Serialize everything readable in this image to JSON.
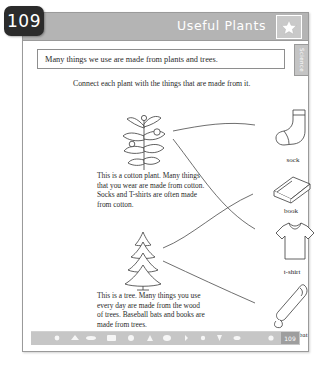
{
  "page": {
    "number_badge": "109",
    "footer_number": "109",
    "subject_tab": "Science"
  },
  "header": {
    "title": "Useful Plants",
    "star_icon": "star-icon"
  },
  "intro": {
    "text": "Many things we use are made from plants and trees."
  },
  "instruction": {
    "text": "Connect each plant with the things that are made from it."
  },
  "plants": [
    {
      "id": "cotton",
      "icon": "cotton-plant-icon",
      "text": "This is a cotton plant. Many things that you wear are made from cotton. Socks and T-shirts are often made from cotton."
    },
    {
      "id": "tree",
      "icon": "pine-tree-icon",
      "text": "This is a tree. Many things you use every day are made from the wood of trees. Baseball bats and books are made from trees."
    }
  ],
  "products": [
    {
      "id": "sock",
      "label": "sock",
      "icon": "sock-icon"
    },
    {
      "id": "book",
      "label": "book",
      "icon": "book-icon"
    },
    {
      "id": "tshirt",
      "label": "t-shirt",
      "icon": "tshirt-icon"
    },
    {
      "id": "baseballbat",
      "label": "baseball bat",
      "icon": "baseball-bat-icon"
    }
  ],
  "connections": [
    {
      "from": "cotton",
      "to": "sock"
    },
    {
      "from": "cotton",
      "to": "tshirt"
    },
    {
      "from": "tree",
      "to": "book"
    },
    {
      "from": "tree",
      "to": "baseballbat"
    }
  ],
  "colors": {
    "header_band": "#b4b4b4",
    "badge": "#2b2b2b",
    "ink": "#2a2a2a",
    "line": "#4a4a4a"
  }
}
